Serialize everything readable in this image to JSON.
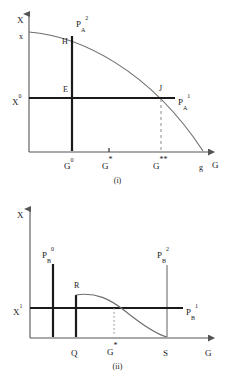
{
  "figure": {
    "panels": [
      {
        "id": "i",
        "caption": "(i)",
        "axes": {
          "y_axis_label": "X",
          "x_axis_label": "G",
          "y_origin_tick": "x",
          "x_end_tick": "g"
        },
        "y_ticks": [
          {
            "name": "x-upper-tick",
            "label": "x",
            "sup": "",
            "sub": ""
          },
          {
            "name": "x-zero-tick",
            "label": "X",
            "sup": "0",
            "sub": ""
          }
        ],
        "x_ticks": [
          {
            "name": "g-zero-tick",
            "label": "G",
            "sup": "0",
            "sub": ""
          },
          {
            "name": "g-star-tick",
            "label": "G",
            "sup": "*",
            "sub": ""
          },
          {
            "name": "g-doublestar-tick",
            "label": "G",
            "sup": "**",
            "sub": ""
          },
          {
            "name": "g-end-tick",
            "label": "g",
            "sup": "",
            "sub": ""
          }
        ],
        "points": [
          {
            "name": "point-h",
            "label": "H"
          },
          {
            "name": "point-e",
            "label": "E"
          },
          {
            "name": "point-j",
            "label": "J"
          }
        ],
        "curves": [
          {
            "name": "ppf-curve",
            "label": "",
            "style": "solid-thin"
          },
          {
            "name": "budget-line-pa2",
            "label": "P",
            "sub": "A",
            "sup": "2",
            "style": "solid-thick-vertical"
          },
          {
            "name": "budget-line-pa1",
            "label": "P",
            "sub": "A",
            "sup": "1",
            "style": "solid-thick-horizontal"
          },
          {
            "name": "dropline-g-doublestar",
            "label": "",
            "style": "dashed"
          }
        ]
      },
      {
        "id": "ii",
        "caption": "(ii)",
        "axes": {
          "y_axis_label": "X",
          "x_axis_label": "G"
        },
        "y_ticks": [
          {
            "name": "x-one-tick",
            "label": "X",
            "sup": "1",
            "sub": ""
          }
        ],
        "x_ticks": [
          {
            "name": "q-tick",
            "label": "Q",
            "sup": "",
            "sub": ""
          },
          {
            "name": "g-star-tick",
            "label": "G",
            "sup": "*",
            "sub": ""
          },
          {
            "name": "s-tick",
            "label": "S",
            "sup": "",
            "sub": ""
          }
        ],
        "points": [
          {
            "name": "point-r",
            "label": "R"
          }
        ],
        "curves": [
          {
            "name": "line-pb0",
            "label": "P",
            "sub": "B",
            "sup": "0",
            "style": "solid-thick-vertical"
          },
          {
            "name": "line-pb2",
            "label": "P",
            "sub": "B",
            "sup": "2",
            "style": "solid-thin-vertical"
          },
          {
            "name": "line-pb1",
            "label": "P",
            "sub": "B",
            "sup": "1",
            "style": "solid-thick-horizontal"
          },
          {
            "name": "reaction-curve",
            "label": "",
            "style": "solid-thin"
          },
          {
            "name": "dropline-g-star",
            "label": "",
            "style": "dotted"
          }
        ]
      }
    ],
    "colors": {
      "ink": "#1a1a1a",
      "axis": "#555555",
      "thick": "#1a1a1a",
      "thin": "#666666",
      "background": "#ffffff"
    }
  }
}
